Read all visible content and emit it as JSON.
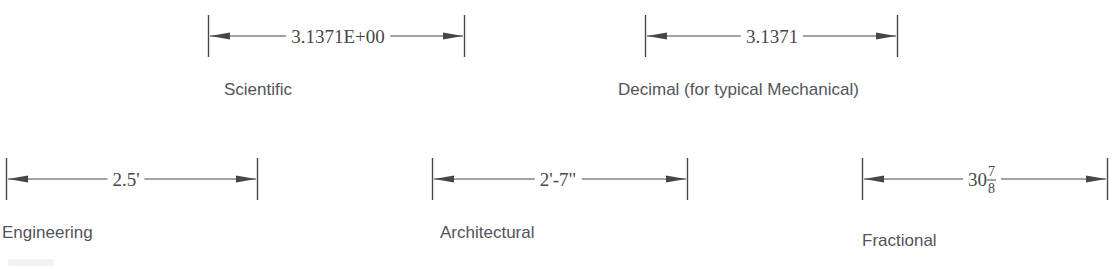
{
  "figure": {
    "stroke_color": "#47474a",
    "value_text_color": "#47474a",
    "label_text_color": "#53535a",
    "background_color": "#ffffff"
  },
  "dimensions": [
    {
      "id": "scientific",
      "value": "3.1371E+00",
      "label": "Scientific",
      "arrow_style": "double-ended-filled",
      "extension_lines": 2
    },
    {
      "id": "decimal",
      "value": "3.1371",
      "label": "Decimal (for typical Mechanical)",
      "arrow_style": "double-ended-filled",
      "extension_lines": 2
    },
    {
      "id": "engineering",
      "value": "2.5'",
      "label": "Engineering",
      "arrow_style": "double-ended-filled",
      "extension_lines": 2
    },
    {
      "id": "architectural",
      "value": "2'-7\"",
      "label": "Architectural",
      "arrow_style": "double-ended-filled",
      "extension_lines": 2
    },
    {
      "id": "fractional",
      "value_whole": "30",
      "value_numerator": "7",
      "value_denominator": "8",
      "value": "30 7/8",
      "label": "Fractional",
      "arrow_style": "double-ended-filled",
      "extension_lines": 2
    }
  ]
}
